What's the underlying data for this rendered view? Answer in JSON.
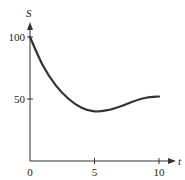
{
  "chart_data": {
    "type": "line",
    "title": "",
    "xlabel": "t",
    "ylabel": "S",
    "xlim": [
      0,
      10
    ],
    "ylim": [
      0,
      100
    ],
    "x_ticks": [
      0,
      5,
      10
    ],
    "y_ticks": [
      50,
      100
    ],
    "x_tick_labels": [
      "0",
      "5",
      "10"
    ],
    "y_tick_labels": [
      "50",
      "100"
    ],
    "grid": false,
    "legend": null,
    "series": [
      {
        "name": "S(t)",
        "x": [
          0,
          1,
          2,
          3,
          4,
          5,
          6,
          7,
          8,
          9,
          10
        ],
        "values": [
          100,
          77,
          61,
          50,
          43,
          40,
          41,
          44,
          48,
          51,
          52
        ]
      }
    ],
    "color": "#333333"
  }
}
